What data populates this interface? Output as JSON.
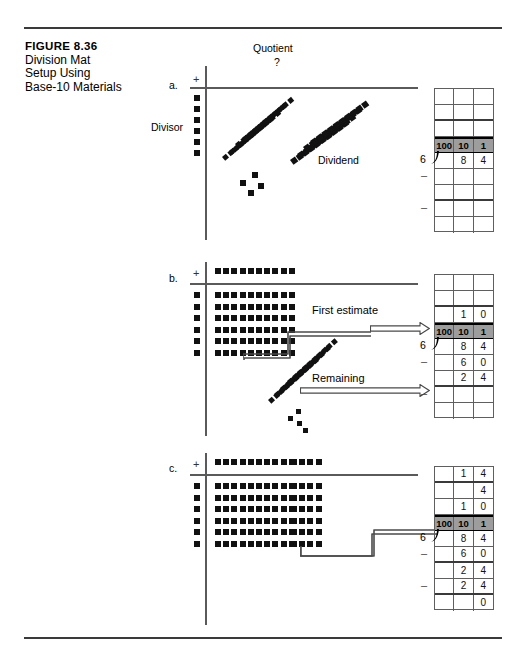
{
  "figure": {
    "number": "FIGURE 8.36",
    "title_lines": [
      "Division Mat",
      "Setup Using",
      "Base-10 Materials"
    ],
    "title": "Division Mat Setup Using Base-10 Materials"
  },
  "mat": {
    "quotient_label": "Quotient",
    "quotient_value": "?",
    "divisor_label": "Divisor",
    "dividend_label": "Dividend",
    "plus_sign": "+"
  },
  "panels": [
    {
      "letter": "a.",
      "mat": {
        "quotient_blocks_tens": 0,
        "quotient_blocks_ones": 0,
        "divisor_blocks": 6,
        "array_rows": 0,
        "array_cols_tens": 0,
        "array_cols_ones": 0,
        "loose_rods": 8,
        "loose_units": 4,
        "shows_tilted_pile": true
      },
      "labels": [
        "Quotient",
        "?",
        "Divisor",
        "Dividend"
      ],
      "callouts": [],
      "table": {
        "divisor": "6",
        "headers": [
          "100",
          "10",
          "1"
        ],
        "rows": [
          {
            "cells": [
              "",
              "",
              ""
            ],
            "marker": "",
            "thick": false
          },
          {
            "cells": [
              "",
              "",
              ""
            ],
            "marker": "",
            "thick": true
          },
          {
            "cells": [
              "",
              "",
              ""
            ],
            "marker": "",
            "thick": false
          },
          {
            "cells": [
              "100",
              "10",
              "1"
            ],
            "marker": "",
            "head": true
          },
          {
            "cells": [
              "",
              "8",
              "4"
            ],
            "marker": "",
            "thick": false
          },
          {
            "cells": [
              "",
              "",
              ""
            ],
            "marker": "–",
            "thick": false
          },
          {
            "cells": [
              "",
              "",
              ""
            ],
            "marker": "",
            "thick": true
          },
          {
            "cells": [
              "",
              "",
              ""
            ],
            "marker": "–",
            "thick": false
          },
          {
            "cells": [
              "",
              "",
              ""
            ],
            "marker": "",
            "thick": false
          }
        ]
      }
    },
    {
      "letter": "b.",
      "mat": {
        "quotient_blocks_tens": 10,
        "quotient_blocks_ones": 0,
        "divisor_blocks": 6,
        "array_rows": 6,
        "array_cols_tens": 10,
        "array_cols_ones": 0,
        "loose_rods": 4,
        "loose_units": 4,
        "shows_tilted_pile": true
      },
      "labels": [],
      "callouts": [
        "First estimate",
        "Remaining"
      ],
      "table": {
        "divisor": "6",
        "headers": [
          "100",
          "10",
          "1"
        ],
        "rows": [
          {
            "cells": [
              "",
              "",
              ""
            ],
            "marker": "",
            "thick": false
          },
          {
            "cells": [
              "",
              "",
              ""
            ],
            "marker": "",
            "thick": true
          },
          {
            "cells": [
              "",
              "1",
              "0"
            ],
            "marker": "",
            "thick": false
          },
          {
            "cells": [
              "100",
              "10",
              "1"
            ],
            "marker": "",
            "head": true
          },
          {
            "cells": [
              "",
              "8",
              "4"
            ],
            "marker": "",
            "thick": false
          },
          {
            "cells": [
              "",
              "6",
              "0"
            ],
            "marker": "–",
            "thick": false
          },
          {
            "cells": [
              "",
              "2",
              "4"
            ],
            "marker": "",
            "thick": true
          },
          {
            "cells": [
              "",
              "",
              ""
            ],
            "marker": "–",
            "thick": false
          },
          {
            "cells": [
              "",
              "",
              ""
            ],
            "marker": "",
            "thick": false
          }
        ]
      }
    },
    {
      "letter": "c.",
      "mat": {
        "quotient_blocks_tens": 10,
        "quotient_blocks_ones": 4,
        "divisor_blocks": 6,
        "array_rows": 6,
        "array_cols_tens": 10,
        "array_cols_ones": 4,
        "loose_rods": 0,
        "loose_units": 0,
        "shows_tilted_pile": false
      },
      "labels": [],
      "callouts": [],
      "table": {
        "divisor": "6",
        "headers": [
          "100",
          "10",
          "1"
        ],
        "rows": [
          {
            "cells": [
              "",
              "1",
              "4"
            ],
            "marker": "",
            "thick": true
          },
          {
            "cells": [
              "",
              "",
              "4"
            ],
            "marker": "",
            "thick": false
          },
          {
            "cells": [
              "",
              "1",
              "0"
            ],
            "marker": "",
            "thick": false
          },
          {
            "cells": [
              "100",
              "10",
              "1"
            ],
            "marker": "",
            "head": true
          },
          {
            "cells": [
              "",
              "8",
              "4"
            ],
            "marker": "",
            "thick": false
          },
          {
            "cells": [
              "",
              "6",
              "0"
            ],
            "marker": "–",
            "thick": true
          },
          {
            "cells": [
              "",
              "2",
              "4"
            ],
            "marker": "",
            "thick": false
          },
          {
            "cells": [
              "",
              "2",
              "4"
            ],
            "marker": "–",
            "thick": true
          },
          {
            "cells": [
              "",
              "",
              "0"
            ],
            "marker": "",
            "thick": false
          }
        ]
      }
    }
  ],
  "colors": {
    "ink": "#111111",
    "rule": "#3a3a3a",
    "grid": "#5f5f5f",
    "header_fill": "#9d9d9d",
    "paper": "#ffffff"
  }
}
